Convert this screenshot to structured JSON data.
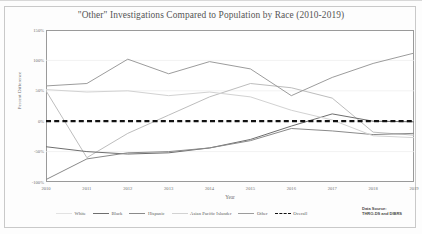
{
  "chart_title": "\"Other\" Investigations Compared to Population by Race (2010-2019)",
  "axes": {
    "ylabel": "Percent Difference",
    "xlabel": "Year",
    "yticks": [
      "150%",
      "100%",
      "50%",
      "0%",
      "-50%",
      "-100%"
    ],
    "xticks": [
      "2010",
      "2011",
      "2012",
      "2013",
      "2014",
      "2015",
      "2016",
      "2017",
      "2018",
      "2019"
    ]
  },
  "source": {
    "line1": "Data Source:",
    "line2": "THRO-DS and DIBRS"
  },
  "legend": [
    {
      "label": "White",
      "color": "#bdbdbd",
      "style": "solid"
    },
    {
      "label": "Black",
      "color": "#6e6e6e",
      "style": "solid"
    },
    {
      "label": "Hispanic",
      "color": "#8a8a8a",
      "style": "solid"
    },
    {
      "label": "Asian Pacific Islander",
      "color": "#d2d2d2",
      "style": "solid"
    },
    {
      "label": "Other",
      "color": "#9c9c9c",
      "style": "solid"
    },
    {
      "label": "Overall",
      "color": "#111111",
      "style": "dashed"
    }
  ],
  "chart_data": {
    "type": "line",
    "title": "\"Other\" Investigations Compared to Population by Race (2010-2019)",
    "xlabel": "Year",
    "ylabel": "Percent Difference",
    "grid": true,
    "legend_position": "bottom",
    "x": [
      "2010",
      "2011",
      "2012",
      "2013",
      "2014",
      "2015",
      "2016",
      "2017",
      "2018",
      "2019"
    ],
    "xlim": [
      "2010",
      "2019"
    ],
    "ylim": [
      -100,
      150
    ],
    "ytick_values": [
      150,
      100,
      50,
      0,
      -50,
      -100
    ],
    "series": [
      {
        "name": "White",
        "color": "#bdbdbd",
        "style": "solid",
        "values": [
          50,
          -60,
          -20,
          10,
          40,
          62,
          55,
          38,
          -18,
          -23
        ]
      },
      {
        "name": "Black",
        "color": "#6e6e6e",
        "style": "solid",
        "values": [
          -42,
          -50,
          -54,
          -52,
          -44,
          -30,
          -8,
          12,
          0,
          -1
        ]
      },
      {
        "name": "Hispanic",
        "color": "#8a8a8a",
        "style": "solid",
        "values": [
          -96,
          -62,
          -52,
          -50,
          -44,
          -32,
          -12,
          -16,
          -22,
          -20
        ]
      },
      {
        "name": "Asian Pacific Islander",
        "color": "#d2d2d2",
        "style": "solid",
        "values": [
          52,
          48,
          50,
          42,
          48,
          40,
          18,
          2,
          -24,
          -27
        ]
      },
      {
        "name": "Other",
        "color": "#9c9c9c",
        "style": "solid",
        "values": [
          58,
          62,
          102,
          78,
          98,
          86,
          42,
          72,
          95,
          112
        ]
      },
      {
        "name": "Overall",
        "color": "#111111",
        "style": "dashed",
        "values": [
          0,
          0,
          0,
          0,
          0,
          0,
          0,
          0,
          0,
          0
        ]
      }
    ]
  }
}
